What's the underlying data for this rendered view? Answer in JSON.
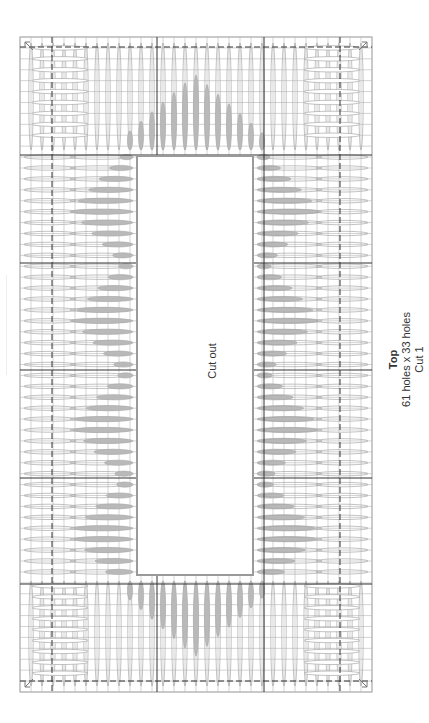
{
  "piece": {
    "title": "Top",
    "dimensions": "61 holes x 33 holes",
    "cut": "Cut 1"
  },
  "cutout": {
    "label": "Cut out"
  },
  "grid": {
    "holes_long": 61,
    "holes_wide": 33,
    "left": 20,
    "top": 37,
    "right": 372,
    "bottom": 692,
    "major_h_lines": [
      155,
      263,
      370,
      478,
      584
    ],
    "major_v_lines": [
      157,
      264
    ],
    "dashed_h_lines": [
      47,
      681
    ],
    "dashed_v_lines": [
      52,
      340
    ],
    "cutout_rect": {
      "x": 137,
      "y": 156,
      "w": 116,
      "h": 419
    }
  },
  "colors": {
    "grid_minor": "#b5b5b5",
    "grid_major": "#333333",
    "stitch_outline": "#a8a8a8",
    "stitch_fill_gray": "#b9b9b9",
    "cutout_border": "#9a9a9a"
  }
}
